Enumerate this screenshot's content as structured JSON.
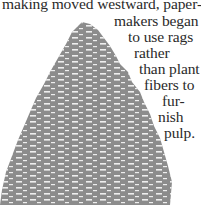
{
  "document": {
    "lines": [
      "making moved westward, paper-",
      "makers began",
      "to use rags",
      "rather",
      "than plant",
      "fibers to",
      "fur-",
      "nish",
      "pulp."
    ],
    "line_positions": [
      {
        "left": 2,
        "top": -4
      },
      {
        "left": 114,
        "top": 13
      },
      {
        "left": 128,
        "top": 29
      },
      {
        "left": 134,
        "top": 45
      },
      {
        "left": 139,
        "top": 61
      },
      {
        "left": 144,
        "top": 77
      },
      {
        "left": 162,
        "top": 93
      },
      {
        "left": 158,
        "top": 109
      },
      {
        "left": 164,
        "top": 125
      }
    ]
  },
  "illustration": {
    "subject": "evergreen tree silhouette",
    "color": "#8c8c8c"
  }
}
